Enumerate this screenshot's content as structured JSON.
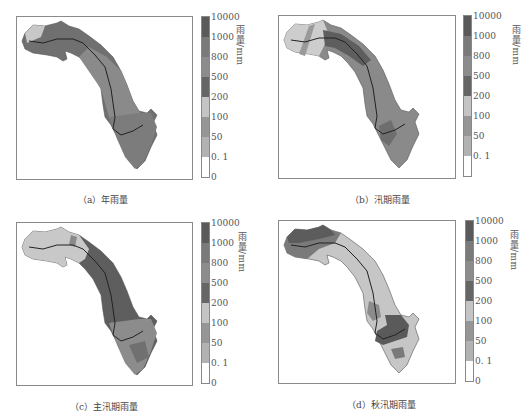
{
  "figure": {
    "unit_label": "雨量/mm",
    "colorbar": {
      "ticks": [
        "10000",
        "1000",
        "800",
        "500",
        "200",
        "100",
        "50",
        "0. 1",
        "0"
      ],
      "colors": [
        "#5a5a5a",
        "#7a7a7a",
        "#8c8c8c",
        "#666666",
        "#c4c4c4",
        "#969696",
        "#b2b2b2",
        "#ffffff"
      ]
    },
    "panels": [
      {
        "id": "a",
        "caption": "（a）年雨量"
      },
      {
        "id": "b",
        "caption": "（b）汛期雨量"
      },
      {
        "id": "c",
        "caption": "（c）主汛期雨量"
      },
      {
        "id": "d",
        "caption": "（d）秋汛期雨量"
      }
    ]
  }
}
